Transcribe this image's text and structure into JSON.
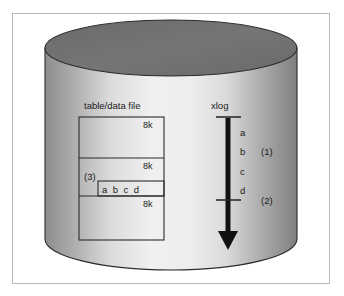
{
  "figure": {
    "colors": {
      "frame_border": "#b9b9b9",
      "cylinder_top_fill": "#6e6e6e",
      "cylinder_body_light": "#f2f2f2",
      "cylinder_body_dark": "#8a8a8a",
      "outline": "#2b2b2b",
      "text": "#1a1a1a",
      "arrow": "#111111",
      "page_background": "#ffffff"
    }
  },
  "table_file": {
    "label": "table/data file",
    "page_markers": [
      {
        "text": "8k"
      },
      {
        "text": "8k"
      },
      {
        "text": "8k"
      }
    ],
    "row_label": "a b c d",
    "callout": "(3)"
  },
  "xlog": {
    "label": "xlog",
    "entries": [
      "a",
      "b",
      "c",
      "d"
    ],
    "callouts": [
      {
        "text": "(1)"
      },
      {
        "text": "(2)"
      }
    ]
  }
}
